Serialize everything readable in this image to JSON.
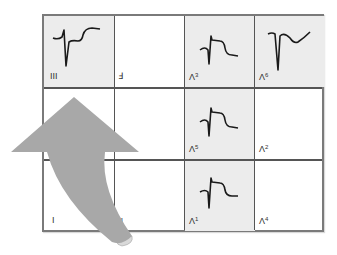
{
  "figure": {
    "type": "ecg-lead-grid",
    "rows": 3,
    "columns": 4,
    "colors": {
      "grid_border": "#7a7a7a",
      "grid_lines": "#555555",
      "shaded_cell": "#ececec",
      "trace": "#1a1a1a",
      "arrow": "#a8a8a8",
      "arrow_curl": "#d9d9d9"
    },
    "cells": [
      {
        "row": 0,
        "col": 0,
        "label": "III",
        "label_sup": "",
        "shaded": true,
        "waveform": "st-depression-deep-s"
      },
      {
        "row": 0,
        "col": 1,
        "label": "Ⅎ",
        "label_sup": "",
        "shaded": false,
        "waveform": "none"
      },
      {
        "row": 0,
        "col": 2,
        "label": "Λ",
        "label_sup": "3",
        "shaded": true,
        "waveform": "st-elevation"
      },
      {
        "row": 0,
        "col": 3,
        "label": "Λ",
        "label_sup": "6",
        "shaded": true,
        "waveform": "deep-q-inverted-t"
      },
      {
        "row": 1,
        "col": 0,
        "label": "",
        "label_sup": "",
        "shaded": false,
        "waveform": "none"
      },
      {
        "row": 1,
        "col": 1,
        "label": "",
        "label_sup": "",
        "shaded": false,
        "waveform": "none"
      },
      {
        "row": 1,
        "col": 2,
        "label": "Λ",
        "label_sup": "5",
        "shaded": true,
        "waveform": "st-elevation"
      },
      {
        "row": 1,
        "col": 3,
        "label": "Λ",
        "label_sup": "2",
        "shaded": false,
        "waveform": "none"
      },
      {
        "row": 2,
        "col": 0,
        "label": "I",
        "label_sup": "",
        "shaded": false,
        "waveform": "none"
      },
      {
        "row": 2,
        "col": 1,
        "label": "ᴚ",
        "label_sup": "",
        "shaded": false,
        "waveform": "none"
      },
      {
        "row": 2,
        "col": 2,
        "label": "Λ",
        "label_sup": "1",
        "shaded": true,
        "waveform": "st-elevation"
      },
      {
        "row": 2,
        "col": 3,
        "label": "Λ",
        "label_sup": "4",
        "shaded": false,
        "waveform": "none"
      }
    ],
    "arrow": {
      "shape": "curved-up-arrow",
      "direction": "up",
      "position": "lower-left over columns 1-2"
    }
  }
}
